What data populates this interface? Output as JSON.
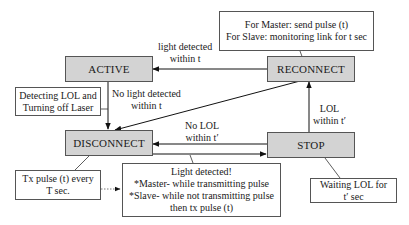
{
  "diagram": {
    "type": "state-diagram",
    "states": {
      "active": "ACTIVE",
      "reconnect": "RECONNECT",
      "disconnect": "DISCONNECT",
      "stop": "STOP"
    },
    "notes": {
      "reconnect": [
        "For Master: send pulse (t)",
        "For Slave: monitoring link for t sec"
      ],
      "active": [
        "Detecting LOL and",
        "Turning off Laser"
      ],
      "disconnect": [
        "Tx pulse (t) every",
        "T sec."
      ],
      "light_detected": [
        "Light detected!",
        "*Master- while transmitting pulse",
        "*Slave- while not transmitting pulse",
        "then tx pulse (t)"
      ],
      "stop": [
        "Waiting LOL for",
        "t′ sec"
      ]
    },
    "transitions": [
      {
        "from": "RECONNECT",
        "to": "ACTIVE",
        "label": [
          "light detected",
          "within t"
        ]
      },
      {
        "from": "ACTIVE",
        "to": "DISCONNECT",
        "label": [
          "No light detected",
          "within t"
        ]
      },
      {
        "from": "RECONNECT",
        "to": "DISCONNECT",
        "label": []
      },
      {
        "from": "STOP",
        "to": "DISCONNECT",
        "label": [
          "No LOL",
          "within t′"
        ]
      },
      {
        "from": "DISCONNECT",
        "to": "STOP",
        "label": []
      },
      {
        "from": "STOP",
        "to": "RECONNECT",
        "label": [
          "LOL",
          "within t′"
        ]
      }
    ]
  }
}
